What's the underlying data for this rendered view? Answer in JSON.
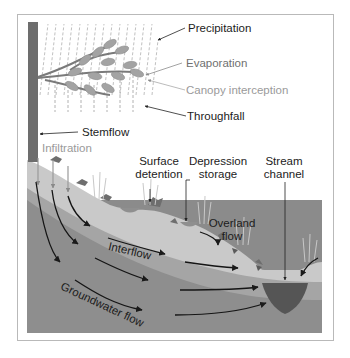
{
  "diagram": {
    "labels": {
      "precipitation": "Precipitation",
      "evaporation": "Evaporation",
      "canopy_interception": "Canopy interception",
      "throughfall": "Throughfall",
      "stemflow": "Stemflow",
      "infiltration": "Infiltration",
      "surface_detention_1": "Surface",
      "surface_detention_2": "detention",
      "depression_storage_1": "Depression",
      "depression_storage_2": "storage",
      "stream_channel_1": "Stream",
      "stream_channel_2": "channel",
      "overland_flow_1": "Overland",
      "overland_flow_2": "flow",
      "interflow": "Interflow",
      "groundwater_flow": "Groundwater flow"
    },
    "colors": {
      "frame": "#b9b9b9",
      "sky": "#ffffff",
      "soil_top": "#c9c9c9",
      "soil_mid": "#a9a9a9",
      "groundwater": "#8b8b8b",
      "stream": "#5a5a5a",
      "trunk": "#6d6d6d",
      "leaves": "#a0a0a0",
      "arrows": "#1a1a1a"
    }
  }
}
